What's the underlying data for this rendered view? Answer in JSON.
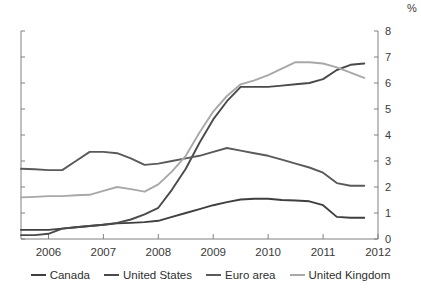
{
  "axis": {
    "unit_label": "%",
    "y_ticks": [
      "0",
      "1",
      "2",
      "3",
      "4",
      "5",
      "6",
      "7",
      "8"
    ],
    "x_ticks": [
      "2006",
      "2007",
      "2008",
      "2009",
      "2010",
      "2011",
      "2012"
    ]
  },
  "legend": {
    "items": [
      {
        "label": "Canada",
        "color": "#3f3f3f"
      },
      {
        "label": "United States",
        "color": "#4a4a4a"
      },
      {
        "label": "Euro area",
        "color": "#5a5a5a"
      },
      {
        "label": "United Kingdom",
        "color": "#a8a8a8"
      }
    ]
  },
  "chart_data": {
    "type": "line",
    "title": "",
    "subtitle": "",
    "xlabel": "",
    "ylabel": "%",
    "xlim": [
      2005.5,
      2012.0
    ],
    "ylim": [
      0,
      8
    ],
    "yticks": [
      0,
      1,
      2,
      3,
      4,
      5,
      6,
      7,
      8
    ],
    "xticks": [
      2006,
      2007,
      2008,
      2009,
      2010,
      2011,
      2012
    ],
    "grid": false,
    "legend_position": "bottom",
    "x": [
      2005.5,
      2005.75,
      2006.0,
      2006.25,
      2006.5,
      2006.75,
      2007.0,
      2007.25,
      2007.5,
      2007.75,
      2008.0,
      2008.25,
      2008.5,
      2008.75,
      2009.0,
      2009.25,
      2009.5,
      2009.75,
      2010.0,
      2010.25,
      2010.5,
      2010.75,
      2011.0,
      2011.25,
      2011.5,
      2011.75
    ],
    "series": [
      {
        "name": "Canada",
        "color": "#3f3f3f",
        "values": [
          0.35,
          0.35,
          0.35,
          0.4,
          0.45,
          0.5,
          0.55,
          0.6,
          0.62,
          0.65,
          0.7,
          0.85,
          1.0,
          1.15,
          1.3,
          1.42,
          1.52,
          1.55,
          1.55,
          1.5,
          1.48,
          1.45,
          1.3,
          0.85,
          0.82,
          0.82
        ]
      },
      {
        "name": "United States",
        "color": "#4a4a4a",
        "values": [
          0.15,
          0.15,
          0.2,
          0.4,
          0.45,
          0.5,
          0.55,
          0.62,
          0.75,
          0.95,
          1.2,
          1.9,
          2.7,
          3.7,
          4.6,
          5.3,
          5.85,
          5.85,
          5.85,
          5.9,
          5.95,
          6.0,
          6.15,
          6.5,
          6.7,
          6.75
        ]
      },
      {
        "name": "Euro area",
        "color": "#5a5a5a",
        "values": [
          2.7,
          2.68,
          2.65,
          2.65,
          3.0,
          3.35,
          3.35,
          3.3,
          3.1,
          2.85,
          2.9,
          3.0,
          3.1,
          3.2,
          3.35,
          3.5,
          3.4,
          3.3,
          3.2,
          3.05,
          2.9,
          2.75,
          2.55,
          2.15,
          2.05,
          2.05
        ]
      },
      {
        "name": "United Kingdom",
        "color": "#a8a8a8",
        "values": [
          1.6,
          1.62,
          1.65,
          1.65,
          1.68,
          1.7,
          1.85,
          2.0,
          1.92,
          1.82,
          2.1,
          2.6,
          3.2,
          4.1,
          4.9,
          5.5,
          5.95,
          6.1,
          6.3,
          6.55,
          6.8,
          6.8,
          6.75,
          6.6,
          6.4,
          6.2
        ]
      }
    ]
  }
}
